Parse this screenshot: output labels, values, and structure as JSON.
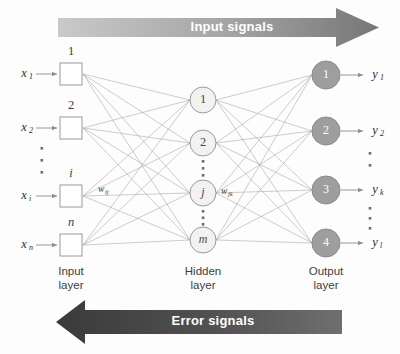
{
  "figure": {
    "background_color": "#fdfdfd"
  },
  "banners": {
    "top": {
      "label": "Input signals",
      "direction": "right",
      "gradient_from": "#c9c9c9",
      "gradient_to": "#767676",
      "text_color": "#ffffff"
    },
    "bottom": {
      "label": "Error signals",
      "direction": "left",
      "gradient_from": "#3a3a3a",
      "gradient_to": "#6f6f6f",
      "text_color": "#ffffff"
    }
  },
  "layers": {
    "input": {
      "caption_line1": "Input",
      "caption_line2": "layer",
      "node_shape": "square",
      "node_fill": "#ffffff",
      "node_stroke": "#9a9a9a",
      "nodes": [
        {
          "index_label": "1",
          "index_italic": false,
          "signal": "x",
          "subscript": "1",
          "cx": 71,
          "cy": 74
        },
        {
          "index_label": "2",
          "index_italic": false,
          "signal": "x",
          "subscript": "2",
          "cx": 71,
          "cy": 128
        },
        {
          "index_label": "i",
          "index_italic": true,
          "signal": "x",
          "subscript": "i",
          "cx": 71,
          "cy": 196
        },
        {
          "index_label": "n",
          "index_italic": true,
          "signal": "x",
          "subscript": "n",
          "cx": 71,
          "cy": 245
        }
      ],
      "ellipsis_between": [
        {
          "after_node": 2,
          "x": 42,
          "y_start": 148,
          "count": 3
        }
      ]
    },
    "hidden": {
      "caption_line1": "Hidden",
      "caption_line2": "layer",
      "node_shape": "circle",
      "node_fill": "#f2f2f2",
      "node_stroke": "#9a9a9a",
      "nodes": [
        {
          "index_label": "1",
          "index_italic": false,
          "cx": 203,
          "cy": 100
        },
        {
          "index_label": "2",
          "index_italic": false,
          "cx": 203,
          "cy": 143
        },
        {
          "index_label": "j",
          "index_italic": true,
          "cx": 203,
          "cy": 193
        },
        {
          "index_label": "m",
          "index_italic": true,
          "cx": 203,
          "cy": 240
        }
      ],
      "ellipsis_between": [
        {
          "x": 203,
          "y_start": 160,
          "count": 3
        },
        {
          "x": 203,
          "y_start": 210,
          "count": 3
        }
      ]
    },
    "output": {
      "caption_line1": "Output",
      "caption_line2": "layer",
      "node_shape": "circle",
      "node_fill": "#9e9e9e",
      "node_stroke": "#8a8a8a",
      "index_color": "#ffffff",
      "nodes": [
        {
          "index_label": "1",
          "signal": "y",
          "subscript": "1",
          "cx": 326,
          "cy": 75
        },
        {
          "index_label": "2",
          "signal": "y",
          "subscript": "2",
          "cx": 326,
          "cy": 131
        },
        {
          "index_label": "3",
          "signal": "y",
          "subscript": "k",
          "cx": 326,
          "cy": 190
        },
        {
          "index_label": "4",
          "signal": "y",
          "subscript": "l",
          "cx": 326,
          "cy": 243
        }
      ],
      "ellipsis_between": [
        {
          "x": 370,
          "y_start": 152,
          "count": 2
        },
        {
          "x": 370,
          "y_start": 207,
          "count": 3
        }
      ]
    }
  },
  "weights": [
    {
      "symbol": "w",
      "subscript": "ij",
      "x": 98,
      "y": 190,
      "describes": "input-to-hidden weight"
    },
    {
      "symbol": "w",
      "subscript": "jk",
      "x": 222,
      "y": 192,
      "describes": "hidden-to-output weight"
    }
  ],
  "styling": {
    "connection_stroke": "#9a9a9a",
    "connection_width": 0.5,
    "io_arrow_stroke": "#8d8d8d",
    "dot_color": "#6d6d6d"
  }
}
